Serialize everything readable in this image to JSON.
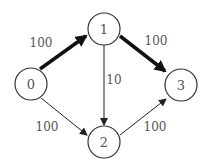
{
  "diagram": {
    "type": "directed-weighted-graph",
    "nodes": [
      {
        "id": "0",
        "label": "0",
        "x": 31,
        "y": 84
      },
      {
        "id": "1",
        "label": "1",
        "x": 104,
        "y": 29
      },
      {
        "id": "2",
        "label": "2",
        "x": 104,
        "y": 142
      },
      {
        "id": "3",
        "label": "3",
        "x": 181,
        "y": 85
      }
    ],
    "edges": [
      {
        "from": "0",
        "to": "1",
        "weight": "100",
        "emphasized": true
      },
      {
        "from": "1",
        "to": "3",
        "weight": "100",
        "emphasized": true
      },
      {
        "from": "1",
        "to": "2",
        "weight": "10",
        "emphasized": false
      },
      {
        "from": "0",
        "to": "2",
        "weight": "100",
        "emphasized": false
      },
      {
        "from": "2",
        "to": "3",
        "weight": "100",
        "emphasized": false
      }
    ],
    "colors": {
      "stroke": "#222222",
      "text": "#555555",
      "background": "#ffffff"
    }
  }
}
